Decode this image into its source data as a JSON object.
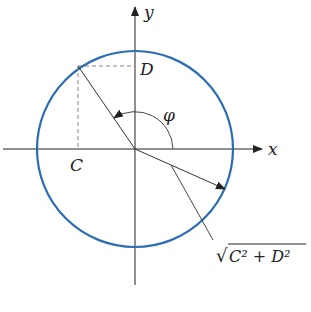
{
  "figure": {
    "type": "circle-phase-diagram",
    "colors": {
      "circle": "#2a6db5",
      "lines": "#333333",
      "dashed": "#777777",
      "background": "#ffffff"
    },
    "axes": {
      "x_label": "x",
      "y_label": "y"
    },
    "points": {
      "C_label": "C",
      "D_label": "D"
    },
    "angle_label": "φ",
    "radius_label": {
      "radical": "√",
      "expr": "C² + D²"
    }
  }
}
